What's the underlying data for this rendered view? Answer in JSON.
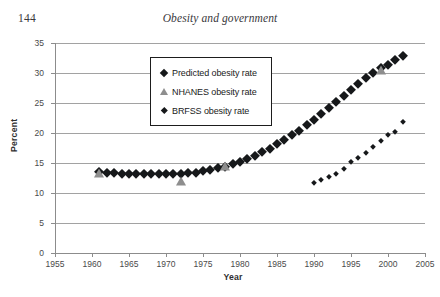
{
  "header": {
    "page_number": "144",
    "running_title": "Obesity and government"
  },
  "legend": {
    "position": "inside-top-left",
    "items": [
      {
        "marker": "diamond-large-black",
        "label": "Predicted obesity rate"
      },
      {
        "marker": "triangle-gray",
        "label": "NHANES obesity rate"
      },
      {
        "marker": "diamond-small-black",
        "label": "BRFSS obesity rate"
      }
    ]
  },
  "chart_data": {
    "type": "scatter",
    "title": "",
    "xlabel": "Year",
    "ylabel": "Percent",
    "xlim": [
      1955,
      2005
    ],
    "ylim": [
      0,
      35
    ],
    "xticks": [
      1955,
      1960,
      1965,
      1970,
      1975,
      1980,
      1985,
      1990,
      1995,
      2000,
      2005
    ],
    "yticks": [
      0,
      5,
      10,
      15,
      20,
      25,
      30,
      35
    ],
    "grid": "horizontal",
    "series": [
      {
        "name": "Predicted obesity rate",
        "marker": "diamond-large-black",
        "color": "#16181a",
        "points": [
          [
            1961,
            13.5
          ],
          [
            1962,
            13.4
          ],
          [
            1963,
            13.3
          ],
          [
            1964,
            13.2
          ],
          [
            1965,
            13.2
          ],
          [
            1966,
            13.1
          ],
          [
            1967,
            13.1
          ],
          [
            1968,
            13.1
          ],
          [
            1969,
            13.1
          ],
          [
            1970,
            13.1
          ],
          [
            1971,
            13.2
          ],
          [
            1972,
            13.2
          ],
          [
            1973,
            13.3
          ],
          [
            1974,
            13.4
          ],
          [
            1975,
            13.6
          ],
          [
            1976,
            13.8
          ],
          [
            1977,
            14.1
          ],
          [
            1978,
            14.4
          ],
          [
            1979,
            14.8
          ],
          [
            1980,
            15.2
          ],
          [
            1981,
            15.7
          ],
          [
            1982,
            16.2
          ],
          [
            1983,
            16.8
          ],
          [
            1984,
            17.4
          ],
          [
            1985,
            18.1
          ],
          [
            1986,
            18.8
          ],
          [
            1987,
            19.6
          ],
          [
            1988,
            20.4
          ],
          [
            1989,
            21.3
          ],
          [
            1990,
            22.2
          ],
          [
            1991,
            23.1
          ],
          [
            1992,
            24.1
          ],
          [
            1993,
            25.1
          ],
          [
            1994,
            26.1
          ],
          [
            1995,
            27.1
          ],
          [
            1996,
            28.1
          ],
          [
            1997,
            29.1
          ],
          [
            1998,
            30.0
          ],
          [
            1999,
            30.8
          ],
          [
            2000,
            31.4
          ],
          [
            2001,
            32.2
          ],
          [
            2002,
            32.9
          ]
        ]
      },
      {
        "name": "NHANES obesity rate",
        "marker": "triangle-gray",
        "color": "#8e8e8e",
        "points": [
          [
            1961,
            13.4
          ],
          [
            1972,
            12.0
          ],
          [
            1978,
            14.5
          ],
          [
            1999,
            30.5
          ]
        ]
      },
      {
        "name": "BRFSS obesity rate",
        "marker": "diamond-small-black",
        "color": "#16181a",
        "points": [
          [
            1990,
            11.6
          ],
          [
            1991,
            12.2
          ],
          [
            1992,
            12.6
          ],
          [
            1993,
            13.2
          ],
          [
            1994,
            14.0
          ],
          [
            1995,
            15.2
          ],
          [
            1996,
            15.8
          ],
          [
            1997,
            16.6
          ],
          [
            1998,
            17.6
          ],
          [
            1999,
            18.6
          ],
          [
            2000,
            19.6
          ],
          [
            2001,
            20.2
          ],
          [
            2002,
            21.9
          ]
        ]
      }
    ]
  }
}
